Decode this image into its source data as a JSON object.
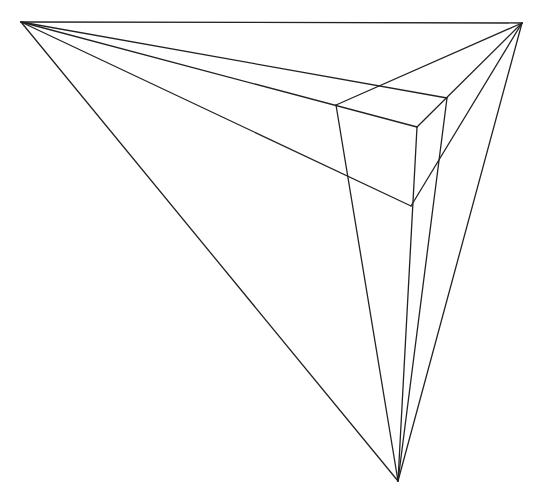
{
  "style": {
    "stroke": "#222222",
    "background": "#ffffff",
    "stroke_width": 1.3
  },
  "vanishing_points": {
    "vp_left": [
      21,
      22
    ],
    "vp_right": [
      522,
      23
    ],
    "vp_bottom": [
      398,
      481
    ]
  },
  "cube": {
    "top_back": [
      383,
      84
    ],
    "top_left": [
      336,
      105
    ],
    "top_right": [
      447,
      98
    ],
    "top_front": [
      417,
      127
    ],
    "bottom_front": [
      411,
      206
    ]
  },
  "lines": [
    {
      "name": "horizon-line",
      "from": [
        21,
        22
      ],
      "to": [
        522,
        23
      ]
    },
    {
      "name": "left-to-bottom-vp-line",
      "from": [
        21,
        22
      ],
      "to": [
        398,
        481
      ]
    },
    {
      "name": "right-to-bottom-vp-line",
      "from": [
        522,
        23
      ],
      "to": [
        398,
        481
      ]
    },
    {
      "name": "vp-left-through-top-back-to-top-right",
      "from": [
        21,
        22
      ],
      "to": [
        447,
        98
      ]
    },
    {
      "name": "vp-left-through-top-left-to-top-front",
      "from": [
        21,
        22
      ],
      "to": [
        417,
        127
      ]
    },
    {
      "name": "vp-left-to-bottom-front",
      "from": [
        21,
        22
      ],
      "to": [
        411,
        206
      ]
    },
    {
      "name": "vp-right-through-top-back-to-top-left",
      "from": [
        522,
        23
      ],
      "to": [
        336,
        105
      ]
    },
    {
      "name": "vp-right-through-top-front-to-bottom-front",
      "from": [
        522,
        23
      ],
      "to": [
        411,
        206
      ]
    },
    {
      "name": "vp-right-to-top-front",
      "from": [
        522,
        23
      ],
      "to": [
        417,
        127
      ]
    },
    {
      "name": "vp-bottom-to-top-left",
      "from": [
        398,
        481
      ],
      "to": [
        336,
        105
      ]
    },
    {
      "name": "vp-bottom-to-top-front",
      "from": [
        398,
        481
      ],
      "to": [
        417,
        127
      ]
    },
    {
      "name": "vp-bottom-to-top-right",
      "from": [
        398,
        481
      ],
      "to": [
        447,
        98
      ]
    }
  ]
}
